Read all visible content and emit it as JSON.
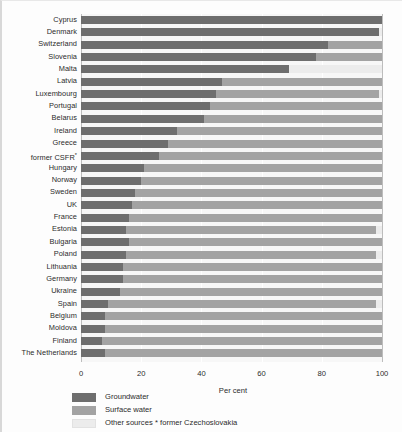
{
  "chart_data": {
    "type": "bar",
    "orientation": "horizontal",
    "stacked": true,
    "title": "",
    "xlabel": "Per cent",
    "ylabel": "",
    "xlim": [
      0,
      100
    ],
    "xticks": [
      0,
      20,
      40,
      60,
      80,
      100
    ],
    "grid": true,
    "legend_position": "bottom-left",
    "footnote": "* former Czechoslovakia",
    "series": [
      {
        "name": "Groundwater",
        "color": "#6e6e6e",
        "key": "groundwater"
      },
      {
        "name": "Surface water",
        "color": "#a3a3a3",
        "key": "surface"
      },
      {
        "name": "Other sources",
        "color": "#ececec",
        "key": "other"
      }
    ],
    "categories": [
      "Cyprus",
      "Denmark",
      "Switzerland",
      "Slovenia",
      "Malta",
      "Latvia",
      "Luxembourg",
      "Portugal",
      "Belarus",
      "Ireland",
      "Greece",
      "former CSFR*",
      "Hungary",
      "Norway",
      "Sweden",
      "UK",
      "France",
      "Estonia",
      "Bulgaria",
      "Poland",
      "Lithuania",
      "Germany",
      "Ukraine",
      "Spain",
      "Belgium",
      "Moldova",
      "Finland",
      "The Netherlands"
    ],
    "rows": [
      {
        "category": "Cyprus",
        "groundwater": 100,
        "surface": 0,
        "other": 0
      },
      {
        "category": "Denmark",
        "groundwater": 99,
        "surface": 0,
        "other": 1
      },
      {
        "category": "Switzerland",
        "groundwater": 82,
        "surface": 18,
        "other": 0
      },
      {
        "category": "Slovenia",
        "groundwater": 78,
        "surface": 22,
        "other": 0
      },
      {
        "category": "Malta",
        "groundwater": 69,
        "surface": 0,
        "other": 31
      },
      {
        "category": "Latvia",
        "groundwater": 47,
        "surface": 53,
        "other": 0
      },
      {
        "category": "Luxembourg",
        "groundwater": 45,
        "surface": 54,
        "other": 1
      },
      {
        "category": "Portugal",
        "groundwater": 43,
        "surface": 57,
        "other": 0
      },
      {
        "category": "Belarus",
        "groundwater": 41,
        "surface": 59,
        "other": 0
      },
      {
        "category": "Ireland",
        "groundwater": 32,
        "surface": 68,
        "other": 0
      },
      {
        "category": "Greece",
        "groundwater": 29,
        "surface": 71,
        "other": 0
      },
      {
        "category": "former CSFR*",
        "groundwater": 26,
        "surface": 74,
        "other": 0
      },
      {
        "category": "Hungary",
        "groundwater": 21,
        "surface": 79,
        "other": 0
      },
      {
        "category": "Norway",
        "groundwater": 20,
        "surface": 80,
        "other": 0
      },
      {
        "category": "Sweden",
        "groundwater": 18,
        "surface": 82,
        "other": 0
      },
      {
        "category": "UK",
        "groundwater": 17,
        "surface": 83,
        "other": 0
      },
      {
        "category": "France",
        "groundwater": 16,
        "surface": 84,
        "other": 0
      },
      {
        "category": "Estonia",
        "groundwater": 15,
        "surface": 83,
        "other": 2
      },
      {
        "category": "Bulgaria",
        "groundwater": 16,
        "surface": 84,
        "other": 0
      },
      {
        "category": "Poland",
        "groundwater": 15,
        "surface": 83,
        "other": 2
      },
      {
        "category": "Lithuania",
        "groundwater": 14,
        "surface": 86,
        "other": 0
      },
      {
        "category": "Germany",
        "groundwater": 14,
        "surface": 86,
        "other": 0
      },
      {
        "category": "Ukraine",
        "groundwater": 13,
        "surface": 87,
        "other": 0
      },
      {
        "category": "Spain",
        "groundwater": 9,
        "surface": 89,
        "other": 2
      },
      {
        "category": "Belgium",
        "groundwater": 8,
        "surface": 92,
        "other": 0
      },
      {
        "category": "Moldova",
        "groundwater": 8,
        "surface": 92,
        "other": 0
      },
      {
        "category": "Finland",
        "groundwater": 7,
        "surface": 93,
        "other": 0
      },
      {
        "category": "The Netherlands",
        "groundwater": 8,
        "surface": 92,
        "other": 0
      }
    ]
  },
  "axis": {
    "title": "Per cent",
    "tick_labels": [
      "0",
      "20",
      "40",
      "60",
      "80",
      "100"
    ]
  },
  "legend": {
    "items": [
      {
        "label": "Groundwater",
        "color": "#6e6e6e"
      },
      {
        "label": "Surface water",
        "color": "#a3a3a3"
      },
      {
        "label": "Other sources",
        "color": "#ececec"
      }
    ]
  },
  "footnote": {
    "text": "* former Czechoslovakia"
  }
}
